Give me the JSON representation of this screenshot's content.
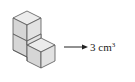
{
  "diagram": {
    "shape": "three unit cubes: two stacked in a column, one adjacent at bottom front-right",
    "cube_count": 3,
    "label": {
      "value": "3",
      "unit": "cm",
      "exponent": "3"
    },
    "arrow": "right-arrow",
    "colors": {
      "top_face": "#e8e8e8",
      "left_face": "#d4d4d4",
      "right_face": "#e4e4e4",
      "edge": "#555555",
      "text": "#222222"
    }
  }
}
